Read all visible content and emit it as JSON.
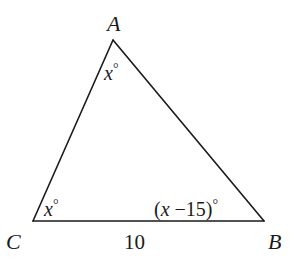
{
  "diagram": {
    "type": "triangle",
    "vertices": {
      "A": {
        "label": "A",
        "x": 113,
        "y": 40
      },
      "B": {
        "label": "B",
        "x": 264,
        "y": 221
      },
      "C": {
        "label": "C",
        "x": 33,
        "y": 221
      }
    },
    "angles": {
      "A": {
        "var": "x",
        "deg": "°"
      },
      "C": {
        "var": "x",
        "deg": "°"
      },
      "B": {
        "open": "(",
        "var": "x",
        "rest": " −15)",
        "deg": "°"
      }
    },
    "sides": {
      "CB": {
        "label": "10"
      }
    },
    "colors": {
      "stroke": "#1a1a1a",
      "background": "#ffffff"
    }
  }
}
